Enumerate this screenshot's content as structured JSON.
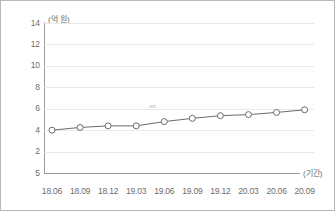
{
  "chart_data": {
    "type": "line",
    "title": "",
    "xlabel": "(기간)",
    "ylabel": "(억 원)",
    "ylim": [
      0,
      14
    ],
    "grid": true,
    "legend": null,
    "y_tick_labels": [
      "14",
      "12",
      "10",
      "8",
      "6",
      "4",
      "2",
      "5"
    ],
    "y_tick_values": [
      14,
      12,
      10,
      8,
      6,
      4,
      2,
      0
    ],
    "categories": [
      "18.06",
      "18.09",
      "18.12",
      "19.03",
      "19.06",
      "19.09",
      "19.12",
      "20.03",
      "20.06",
      "20.09"
    ],
    "values": [
      4.0,
      4.25,
      4.4,
      4.4,
      4.8,
      5.1,
      5.35,
      5.45,
      5.65,
      5.9
    ],
    "marker": "open-circle",
    "line_color": "#6b6b6b",
    "marker_edge_color": "#6b6b6b",
    "marker_fill_color": "#ffffff",
    "grid_color": "#e9e9e9",
    "axis_color": "#9a9a9a",
    "text_color": "#6d6d6d"
  }
}
